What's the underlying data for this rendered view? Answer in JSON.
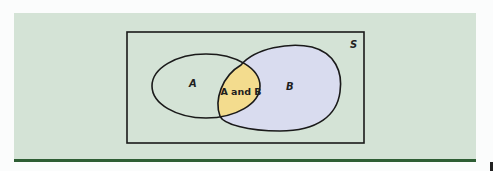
{
  "diagram": {
    "type": "venn",
    "sample_space_label": "S",
    "sets": [
      {
        "id": "A",
        "label": "A",
        "fill": "#d4e3d6"
      },
      {
        "id": "B",
        "label": "B",
        "fill": "#d9dcef"
      }
    ],
    "intersection": {
      "label": "A and B",
      "fill": "#f3dc8e"
    }
  },
  "colors": {
    "panel_background": "#d4e3d6",
    "rule_line": "#2e5e34",
    "outline": "#1a1a1a",
    "page_background": "#fbfcfc"
  }
}
